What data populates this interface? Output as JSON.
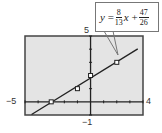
{
  "chart_data": {
    "type": "scatter",
    "title": "",
    "xlabel": "",
    "ylabel": "",
    "xlim": [
      -5,
      4
    ],
    "ylim": [
      -1,
      5
    ],
    "x_tick_labels": [
      "-5",
      "4"
    ],
    "y_tick_labels": [
      "-1",
      "5"
    ],
    "grid": false,
    "background": "#e6e6e6",
    "points": [
      {
        "x": -3,
        "y": 0
      },
      {
        "x": -1,
        "y": 1
      },
      {
        "x": 0,
        "y": 2
      },
      {
        "x": 2,
        "y": 3
      }
    ],
    "regression_line": {
      "slope": 0.6154,
      "intercept": 1.8077,
      "label": "y = 8/13 x + 47/26"
    },
    "annotation": "y = 8/13 x + 47/26"
  },
  "labels": {
    "xmin": "−5",
    "xmax": "4",
    "ymax": "5",
    "ymin": "−1"
  },
  "equation": {
    "lhs": "y",
    "eq": "=",
    "slope_num": "8",
    "slope_den": "13",
    "var": "x",
    "plus": "+",
    "int_num": "47",
    "int_den": "26"
  }
}
